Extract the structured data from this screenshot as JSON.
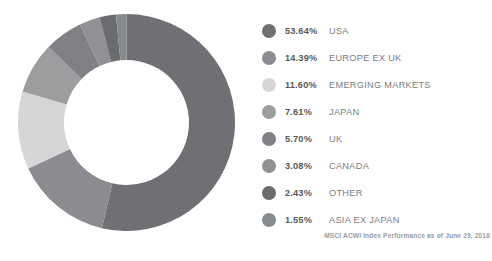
{
  "chart_data": {
    "type": "pie",
    "variant": "donut",
    "title": "",
    "footnote": "MSCI ACWI Index Performance as of June 29, 2018",
    "unit": "percent",
    "start_angle_deg": 0,
    "direction": "clockwise",
    "categories": [
      "USA",
      "EUROPE EX UK",
      "EMERGING MARKETS",
      "JAPAN",
      "UK",
      "CANADA",
      "OTHER",
      "ASIA EX JAPAN"
    ],
    "values": [
      53.64,
      14.39,
      11.6,
      7.61,
      5.7,
      3.08,
      2.43,
      1.55
    ],
    "labels": [
      "53.64%",
      "14.39%",
      "11.60%",
      "7.61%",
      "5.70%",
      "3.08%",
      "2.43%",
      "1.55%"
    ],
    "colors": [
      "#6e7073",
      "#8a8c8f",
      "#d5d6d7",
      "#9b9d9f",
      "#7f8184",
      "#8f9193",
      "#6a6c6f",
      "#878a8c"
    ],
    "legend_position": "right",
    "grid": false
  },
  "legend": {
    "items": [
      {
        "pct": "53.64%",
        "label": "USA",
        "color": "#6e7073",
        "swatch_name": "legend-swatch-usa"
      },
      {
        "pct": "14.39%",
        "label": "EUROPE EX UK",
        "color": "#8a8c8f",
        "swatch_name": "legend-swatch-europe-ex-uk"
      },
      {
        "pct": "11.60%",
        "label": "EMERGING MARKETS",
        "color": "#d5d6d7",
        "swatch_name": "legend-swatch-emerging-markets"
      },
      {
        "pct": "7.61%",
        "label": "JAPAN",
        "color": "#9b9d9f",
        "swatch_name": "legend-swatch-japan"
      },
      {
        "pct": "5.70%",
        "label": "UK",
        "color": "#7f8184",
        "swatch_name": "legend-swatch-uk"
      },
      {
        "pct": "3.08%",
        "label": "CANADA",
        "color": "#8f9193",
        "swatch_name": "legend-swatch-canada"
      },
      {
        "pct": "2.43%",
        "label": "OTHER",
        "color": "#6a6c6f",
        "swatch_name": "legend-swatch-other"
      },
      {
        "pct": "1.55%",
        "label": "ASIA EX JAPAN",
        "color": "#878a8c",
        "swatch_name": "legend-swatch-asia-ex-japan"
      }
    ]
  },
  "footnote": {
    "text": "MSCI ACWI Index Performance as of June 29, 2018"
  }
}
